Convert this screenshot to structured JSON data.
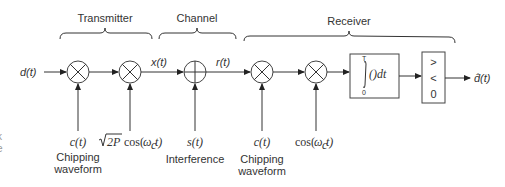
{
  "sections": {
    "transmitter": "Transmitter",
    "channel": "Channel",
    "receiver": "Receiver"
  },
  "signals": {
    "input": "d(t)",
    "transmitted": "x(t)",
    "received": "r(t)",
    "output": "d̂(t)"
  },
  "inputs": {
    "tx_chip": {
      "symbol": "c(t)",
      "caption_line1": "Chipping",
      "caption_line2": "waveform"
    },
    "tx_carrier": {
      "sqrt": "2P",
      "func": "cos(",
      "omega": "ω",
      "sub": "c",
      "tail": "t)"
    },
    "interference": {
      "symbol": "s(t)",
      "caption": "Interference"
    },
    "rx_chip": {
      "symbol": "c(t)",
      "caption_line1": "Chipping",
      "caption_line2": "waveform"
    },
    "rx_carrier": {
      "func": "cos(",
      "omega": "ω",
      "sub": "c",
      "tail": "t)"
    }
  },
  "blocks": {
    "integrator": {
      "upper": "T",
      "lower": "0",
      "body": "()dt"
    },
    "decision": {
      "gt": ">",
      "lt": "<",
      "threshold": "0"
    }
  },
  "edge_fragments": [
    "k",
    "e"
  ]
}
